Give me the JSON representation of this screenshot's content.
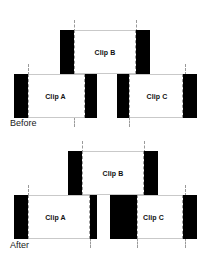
{
  "figure": {
    "colors": {
      "handle": "#000000",
      "clip_body": "#ffffff",
      "clip_border": "#c9c9c9",
      "guide_line": "#9a9a9a",
      "text": "#111111",
      "background": "#ffffff"
    }
  },
  "sections": [
    {
      "key": "before",
      "caption": "Before",
      "clips": [
        {
          "id": "clip-b",
          "label": "Clip B",
          "row": "top",
          "left": 60,
          "width": 90,
          "top": 30,
          "height": 44,
          "handle_left_width": 14,
          "handle_right_width": 14
        },
        {
          "id": "clip-a",
          "label": "Clip A",
          "row": "bottom",
          "left": 14,
          "width": 83,
          "top": 74,
          "height": 44,
          "handle_left_width": 14,
          "handle_right_width": 12
        },
        {
          "id": "clip-c",
          "label": "Clip C",
          "row": "bottom",
          "left": 117,
          "width": 80,
          "top": 74,
          "height": 44,
          "handle_left_width": 12,
          "handle_right_width": 14
        }
      ],
      "ticks": [
        {
          "x": 74,
          "top": 20,
          "height": 12
        },
        {
          "x": 136,
          "top": 20,
          "height": 12
        },
        {
          "x": 28,
          "top": 64,
          "height": 12
        },
        {
          "x": 185,
          "top": 64,
          "height": 12
        },
        {
          "x": 74,
          "top": 116,
          "height": 12
        },
        {
          "x": 129,
          "top": 116,
          "height": 12
        },
        {
          "x": 28,
          "top": 116,
          "height": 12
        },
        {
          "x": 185,
          "top": 116,
          "height": 12
        }
      ]
    },
    {
      "key": "after",
      "caption": "After",
      "clips": [
        {
          "id": "clip-b",
          "label": "Clip B",
          "row": "top",
          "left": 68,
          "width": 90,
          "top": 20,
          "height": 44,
          "handle_left_width": 14,
          "handle_right_width": 14
        },
        {
          "id": "clip-a",
          "label": "Clip A",
          "row": "bottom",
          "left": 14,
          "width": 83,
          "top": 64,
          "height": 44,
          "handle_left_width": 14,
          "handle_right_width": 7
        },
        {
          "id": "clip-c",
          "label": "Clip C",
          "row": "bottom",
          "left": 110,
          "width": 87,
          "top": 64,
          "height": 44,
          "handle_left_width": 27,
          "handle_right_width": 14
        }
      ],
      "ticks": [
        {
          "x": 82,
          "top": 10,
          "height": 12
        },
        {
          "x": 144,
          "top": 10,
          "height": 12
        },
        {
          "x": 28,
          "top": 54,
          "height": 12
        },
        {
          "x": 185,
          "top": 54,
          "height": 12
        },
        {
          "x": 90,
          "top": 106,
          "height": 12
        },
        {
          "x": 137,
          "top": 106,
          "height": 12
        },
        {
          "x": 185,
          "top": 106,
          "height": 12
        }
      ]
    }
  ]
}
